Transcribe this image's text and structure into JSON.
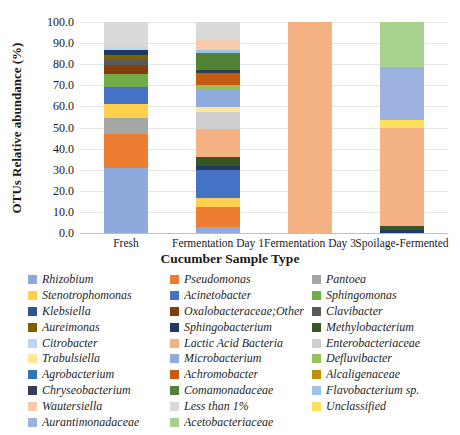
{
  "chart_data": {
    "type": "bar",
    "stacked": true,
    "title": "",
    "xlabel": "Cucumber Sample Type",
    "ylabel": "OTUs Relative abundance (%)",
    "ylim": [
      0,
      100
    ],
    "ytick_step": 10,
    "ytick_format_decimals": 1,
    "grid": true,
    "legend_position": "bottom",
    "categories": [
      "Fresh",
      "Fermentation Day 1",
      "Fermentation Day 3",
      "Spoilage-Fermented"
    ],
    "series": [
      {
        "name": "Rhizobium",
        "color": "#8EA9DB",
        "values": [
          31,
          3,
          0,
          0
        ]
      },
      {
        "name": "Pseudomonas",
        "color": "#ED7D31",
        "values": [
          16,
          9.4,
          0,
          0
        ]
      },
      {
        "name": "Pantoea",
        "color": "#A6A6A6",
        "values": [
          7.5,
          0,
          0,
          0
        ]
      },
      {
        "name": "Stenotrophomonas",
        "color": "#FFD04D",
        "values": [
          6.5,
          4,
          0,
          0
        ]
      },
      {
        "name": "Acinetobacter",
        "color": "#4472C4",
        "values": [
          8,
          13.5,
          0,
          0
        ]
      },
      {
        "name": "Sphingomonas",
        "color": "#70AD47",
        "values": [
          6.5,
          0,
          0,
          0
        ]
      },
      {
        "name": "Klebsiella",
        "color": "#2F5597",
        "values": [
          0,
          0,
          0,
          0
        ]
      },
      {
        "name": "Oxalobacteraceae;Other",
        "color": "#843C0C",
        "values": [
          4,
          0,
          0,
          0
        ]
      },
      {
        "name": "Clavibacter",
        "color": "#595959",
        "values": [
          2.4,
          0,
          0,
          0
        ]
      },
      {
        "name": "Aureimonas",
        "color": "#7F6000",
        "values": [
          2.3,
          0,
          0,
          0
        ]
      },
      {
        "name": "Sphingobacterium",
        "color": "#203864",
        "values": [
          2.5,
          2,
          0,
          1.4
        ]
      },
      {
        "name": "Methylobacterium",
        "color": "#375623",
        "values": [
          0,
          4,
          0,
          1.9
        ]
      },
      {
        "name": "Citrobacter",
        "color": "#BDD7EE",
        "values": [
          1.4,
          0,
          0,
          0
        ]
      },
      {
        "name": "Lactic Acid Bacteria",
        "color": "#F4B183",
        "values": [
          0,
          13.6,
          100,
          46.3
        ]
      },
      {
        "name": "Enterobacteriaceae",
        "color": "#D0CECE",
        "values": [
          0,
          7.9,
          0,
          0
        ]
      },
      {
        "name": "Trabulsiella",
        "color": "#FFE699",
        "values": [
          0,
          2.3,
          0,
          0
        ]
      },
      {
        "name": "Microbacterium",
        "color": "#8FAADC",
        "values": [
          0,
          8.7,
          0,
          0
        ]
      },
      {
        "name": "Defluvibacter",
        "color": "#97C25F",
        "values": [
          0,
          1.6,
          0,
          0
        ]
      },
      {
        "name": "Agrobacterium",
        "color": "#2E75B6",
        "values": [
          0,
          0,
          0,
          0
        ]
      },
      {
        "name": "Achromobacter",
        "color": "#C55A11",
        "values": [
          0,
          5.9,
          0,
          0
        ]
      },
      {
        "name": "Alcaligenaceae",
        "color": "#BF8F00",
        "values": [
          0,
          0,
          0,
          0
        ]
      },
      {
        "name": "Chryseobacterium",
        "color": "#333F50",
        "values": [
          0,
          1.6,
          0,
          0
        ]
      },
      {
        "name": "Comamonadaceae",
        "color": "#548235",
        "values": [
          0,
          7.9,
          0,
          0
        ]
      },
      {
        "name": "Flavobacterium sp.",
        "color": "#9DC3E6",
        "values": [
          0,
          1.2,
          0,
          0
        ]
      },
      {
        "name": "Wautersiella",
        "color": "#F8CBAD",
        "values": [
          0,
          4.8,
          0,
          0
        ]
      },
      {
        "name": "Less than 1%",
        "color": "#D9D9D9",
        "values": [
          11.9,
          8.6,
          0,
          0
        ]
      },
      {
        "name": "Unclassified",
        "color": "#FFE05C",
        "values": [
          0,
          0,
          0,
          4
        ]
      },
      {
        "name": "Aurantimonadaceae",
        "color": "#9DB2DF",
        "values": [
          0,
          0,
          0,
          25.2
        ]
      },
      {
        "name": "Acetobacteriaceae",
        "color": "#A9D18E",
        "values": [
          0,
          0,
          0,
          21.2
        ]
      }
    ]
  }
}
